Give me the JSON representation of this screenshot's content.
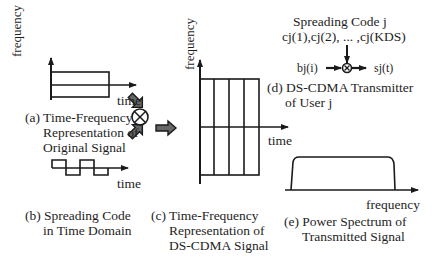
{
  "panel_a": {
    "y_axis_label": "frequency",
    "x_axis_label": "time",
    "caption_line1": "(a) Time-Frequency",
    "caption_line2": "Representation of",
    "caption_line3": "Original Signal"
  },
  "panel_b": {
    "x_axis_label": "time",
    "caption_line1": "(b) Spreading Code",
    "caption_line2": "in Time Domain"
  },
  "panel_c": {
    "y_axis_label": "frequency",
    "x_axis_label": "time",
    "caption_line1": "(c) Time-Frequency",
    "caption_line2": "Representation of",
    "caption_line3": "DS-CDMA Signal"
  },
  "panel_d": {
    "code_title": "Spreading Code j",
    "code_sequence": "cj(1),cj(2), ... ,cj(KDS)",
    "input_label": "bj(i)",
    "output_label": "sj(t)",
    "caption_line1": "(d) DS-CDMA Transmitter",
    "caption_line2": "of User j"
  },
  "panel_e": {
    "x_axis_label": "frequency",
    "caption_line1": "(e) Power Spectrum of",
    "caption_line2": "Transmitted Signal"
  },
  "symbols": {
    "multiply": "⊗"
  }
}
